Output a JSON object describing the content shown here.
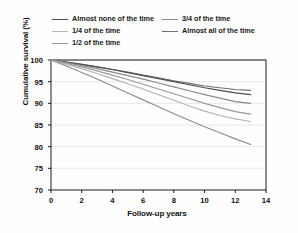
{
  "chart_data": {
    "type": "line",
    "title": "",
    "subtitle": "",
    "xlabel": "Follow-up years",
    "ylabel": "Cumulative survival (%)",
    "xlim": [
      0,
      14
    ],
    "ylim": [
      70,
      100
    ],
    "xticks": [
      0,
      2,
      4,
      6,
      8,
      10,
      12,
      14
    ],
    "yticks": [
      70,
      75,
      80,
      85,
      90,
      95,
      100
    ],
    "grid": "horizontal",
    "legend_position": "top",
    "legend_columns": 2,
    "x": [
      0,
      1,
      2,
      3,
      4,
      5,
      6,
      7,
      8,
      9,
      10,
      11,
      12,
      13
    ],
    "series": [
      {
        "name": "Almost all of the time",
        "color": "#6e6e6e",
        "values": [
          100.0,
          99.5,
          99.0,
          98.4,
          97.8,
          97.2,
          96.5,
          95.9,
          95.2,
          94.6,
          94.0,
          93.6,
          93.2,
          93.0
        ]
      },
      {
        "name": "Almost none of the time",
        "color": "#4d4d4d",
        "values": [
          100.0,
          99.5,
          99.0,
          98.4,
          97.8,
          97.1,
          96.4,
          95.7,
          95.0,
          94.3,
          93.6,
          93.0,
          92.4,
          92.0
        ]
      },
      {
        "name": "3/4 of the time",
        "color": "#8a8a8a",
        "values": [
          100.0,
          99.4,
          98.7,
          98.0,
          97.2,
          96.4,
          95.6,
          94.7,
          93.8,
          92.9,
          92.0,
          91.2,
          90.4,
          90.0
        ]
      },
      {
        "name": "1/2 of the time",
        "color": "#9a9a9a",
        "values": [
          100.0,
          99.2,
          98.4,
          97.5,
          96.5,
          95.5,
          94.4,
          93.3,
          92.2,
          91.1,
          90.0,
          89.0,
          88.1,
          87.5
        ]
      },
      {
        "name": "1/4 of the time",
        "color": "#b4b4b4",
        "values": [
          100.0,
          99.0,
          98.0,
          96.9,
          95.7,
          94.5,
          93.3,
          92.0,
          90.7,
          89.4,
          88.2,
          87.2,
          86.4,
          85.8
        ]
      },
      {
        "name": "1/2 of the time (lowest)",
        "color": "#8d8d8d",
        "values": [
          100.0,
          98.6,
          97.1,
          95.6,
          94.0,
          92.4,
          90.8,
          89.2,
          87.6,
          86.1,
          84.6,
          83.2,
          81.8,
          80.5
        ]
      }
    ]
  },
  "legend": {
    "items": [
      {
        "label": "Almost none of the time",
        "color": "#4d4d4d"
      },
      {
        "label": "3/4 of the time",
        "color": "#8a8a8a"
      },
      {
        "label": "1/4 of the time",
        "color": "#b4b4b4"
      },
      {
        "label": "Almost all of the time",
        "color": "#6e6e6e"
      },
      {
        "label": "1/2 of the time",
        "color": "#9a9a9a"
      }
    ]
  },
  "axes": {
    "ylabel": "Cumulative survival (%)",
    "xlabel": "Follow-up years",
    "yticks": [
      "100",
      "95",
      "90",
      "85",
      "80",
      "75",
      "70"
    ],
    "xticks": [
      "0",
      "2",
      "4",
      "6",
      "8",
      "10",
      "12",
      "14"
    ]
  },
  "colors": {
    "axis": "#1a1a1a",
    "grid": "#e2e2e2",
    "background": "#fefefe",
    "text": "#111111"
  }
}
